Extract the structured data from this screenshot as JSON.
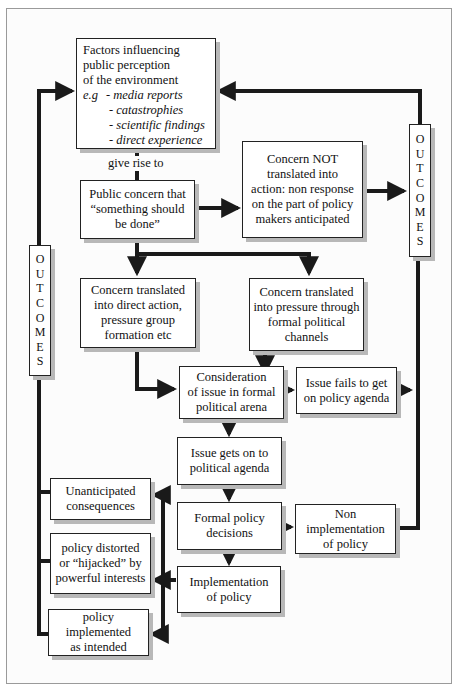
{
  "diagram": {
    "factors": {
      "title_lines": [
        "Factors influencing",
        "public perception",
        "of the environment"
      ],
      "eg_label": "e.g",
      "examples": [
        "- media reports",
        "- catastrophies",
        "- scientific findings",
        "- direct experience"
      ]
    },
    "give_rise_label": "give rise to",
    "public_concern": [
      "Public concern that",
      "“something should",
      "be done”"
    ],
    "concern_not": [
      "Concern NOT",
      "translated into",
      "action: non response",
      "on the part of policy",
      "makers anticipated"
    ],
    "direct_action": [
      "Concern translated",
      "into direct action,",
      "pressure group",
      "formation etc"
    ],
    "formal_pressure": [
      "Concern translated",
      "into pressure through",
      "formal political",
      "channels"
    ],
    "consideration": [
      "Consideration",
      "of issue in formal",
      "political arena"
    ],
    "issue_fails": [
      "Issue fails to get",
      "on policy agenda"
    ],
    "issue_gets": [
      "Issue gets on to",
      "political agenda"
    ],
    "formal_decisions": [
      "Formal policy",
      "decisions"
    ],
    "non_implementation": [
      "Non",
      "implementation",
      "of policy"
    ],
    "implementation": [
      "Implementation",
      "of policy"
    ],
    "unanticipated": [
      "Unanticipated",
      "consequences"
    ],
    "distorted": [
      "policy distorted",
      "or “hijacked” by",
      "powerful interests"
    ],
    "as_intended": [
      "policy",
      "implemented",
      "as intended"
    ],
    "outcomes_left": [
      "O",
      "U",
      "T",
      "C",
      "O",
      "M",
      "E",
      "S"
    ],
    "outcomes_right": [
      "O",
      "U",
      "T",
      "C",
      "O",
      "M",
      "E",
      "S"
    ]
  },
  "colors": {
    "line": "#1a1a1a",
    "shadow": "#b8b8b8",
    "frame": "#9a9a9a"
  }
}
